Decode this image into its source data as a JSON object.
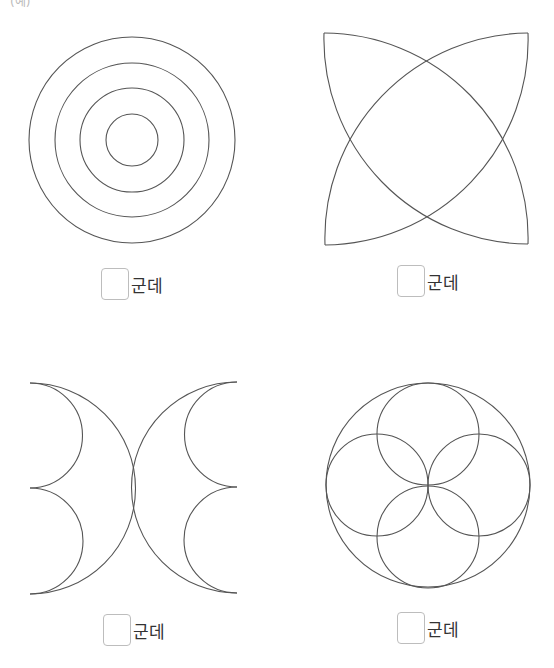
{
  "top_fragment": "(예)",
  "figures": [
    {
      "id": "concentric-circles",
      "answer_unit": "군데"
    },
    {
      "id": "crossed-lenses",
      "answer_unit": "군데"
    },
    {
      "id": "crescent-pair",
      "answer_unit": "군데"
    },
    {
      "id": "four-petal-circles",
      "answer_unit": "군데"
    }
  ],
  "colors": {
    "stroke": "#555555",
    "box_border": "#bdbdbd"
  }
}
